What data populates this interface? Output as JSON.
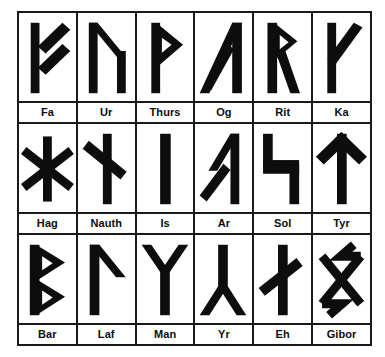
{
  "chart": {
    "type": "rune-grid",
    "rows": 3,
    "columns": 6,
    "total_runes": 18,
    "colors": {
      "background": "#ffffff",
      "border": "#1a1a1a",
      "glyph": "#0d0d0d",
      "label": "#0d0d0d"
    }
  },
  "runes": [
    [
      {
        "label": "Fa",
        "icon": "rune-fa-icon"
      },
      {
        "label": "Ur",
        "icon": "rune-ur-icon"
      },
      {
        "label": "Thurs",
        "icon": "rune-thurs-icon"
      },
      {
        "label": "Og",
        "icon": "rune-og-icon"
      },
      {
        "label": "Rit",
        "icon": "rune-rit-icon"
      },
      {
        "label": "Ka",
        "icon": "rune-ka-icon"
      }
    ],
    [
      {
        "label": "Hag",
        "icon": "rune-hag-icon"
      },
      {
        "label": "Nauth",
        "icon": "rune-nauth-icon"
      },
      {
        "label": "Is",
        "icon": "rune-is-icon"
      },
      {
        "label": "Ar",
        "icon": "rune-ar-icon"
      },
      {
        "label": "Sol",
        "icon": "rune-sol-icon"
      },
      {
        "label": "Tyr",
        "icon": "rune-tyr-icon"
      }
    ],
    [
      {
        "label": "Bar",
        "icon": "rune-bar-icon"
      },
      {
        "label": "Laf",
        "icon": "rune-laf-icon"
      },
      {
        "label": "Man",
        "icon": "rune-man-icon"
      },
      {
        "label": "Yr",
        "icon": "rune-yr-icon"
      },
      {
        "label": "Eh",
        "icon": "rune-eh-icon"
      },
      {
        "label": "Gibor",
        "icon": "rune-gibor-icon"
      }
    ]
  ]
}
